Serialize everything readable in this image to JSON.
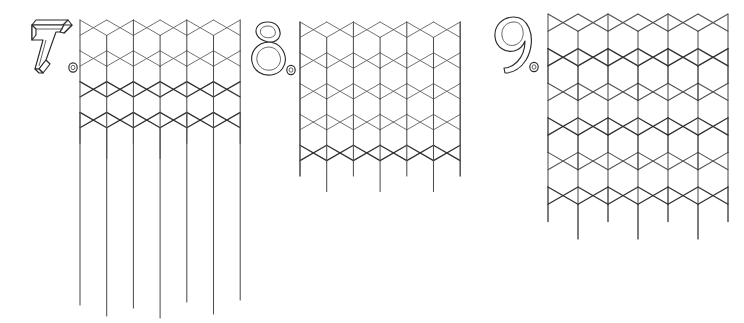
{
  "page": {
    "background_color": "#ffffff",
    "width": 744,
    "height": 323
  },
  "stroke_colors": {
    "light": "#6a6a6a",
    "medium": "#4f4f4f",
    "dark": "#2e2e2e",
    "numeral_outline": "#2b2b2b"
  },
  "figures": [
    {
      "number": "7",
      "numeral_label": "7.",
      "numeral_style": "outlined-3d-shadow",
      "period": ".",
      "name": "pattern-7-tumbling-blocks-with-trailing-verticals",
      "description": "Isometric lattice of rhombi and cube tops, top half formed of cube-top hexagons, lower half of horizontal rhombus bands, with seven long vertical lines continuing to the bottom of the sheet.",
      "origin": {
        "x": 80,
        "y": 20
      },
      "cell": {
        "dx": 26.7,
        "dy": 15.4
      },
      "columns": 7,
      "vertical_lines": 7,
      "vertical_line_x": [
        80,
        106.7,
        133.4,
        160.1,
        186.8,
        213.5,
        240.2
      ],
      "vertical_line_bottom_y": [
        305,
        316,
        308,
        318,
        302,
        314,
        300
      ],
      "lattice_bottom_y": 180
    },
    {
      "number": "8",
      "numeral_label": "8.",
      "numeral_style": "outlined-3d-shadow",
      "period": ".",
      "name": "pattern-8-zigzag-bordered-isometric-lattice",
      "description": "Isometric lattice of cube tops and rhombi with straight left and right edges and a zig-zag sawtooth bottom border.",
      "origin": {
        "x": 300,
        "y": 22
      },
      "cell": {
        "dx": 26.7,
        "dy": 15.4
      },
      "columns": 7,
      "rows": 5,
      "lattice_bottom_y": 192
    },
    {
      "number": "9",
      "numeral_label": "9.",
      "numeral_style": "outlined-3d-shadow",
      "period": ".",
      "name": "pattern-9-tumbling-blocks-cube-tiling",
      "description": "Classic rhombille tumbling-blocks tiling of 3D cubes, rendered with alternating light and dark rhombus outlines.",
      "origin": {
        "x": 548,
        "y": 14
      },
      "cell": {
        "dx": 30.0,
        "dy": 17.3
      },
      "columns": 6,
      "rows": 6,
      "lattice_bottom_y": 190
    }
  ]
}
